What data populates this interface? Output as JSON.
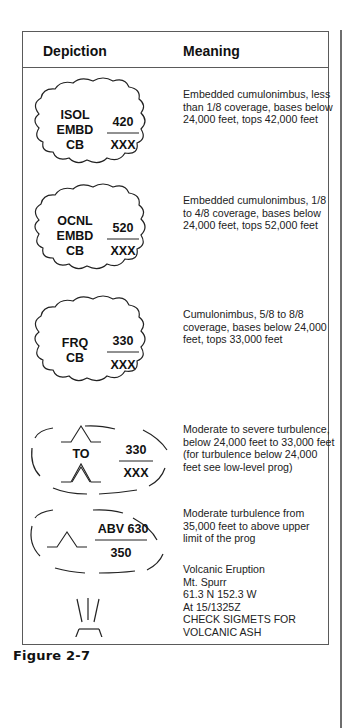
{
  "table": {
    "headers": {
      "depiction": "Depiction",
      "meaning": "Meaning"
    },
    "rows": [
      {
        "symbol": {
          "type": "cloud",
          "left_lines": [
            "ISOL",
            "EMBD",
            "CB"
          ],
          "top": "420",
          "bottom": "XXX"
        },
        "meaning_lines": [
          "Embedded cumulonimbus, less",
          "than 1/8 coverage, bases below",
          "24,000 feet, tops 42,000 feet"
        ]
      },
      {
        "symbol": {
          "type": "cloud",
          "left_lines": [
            "OCNL",
            "EMBD",
            "CB"
          ],
          "top": "520",
          "bottom": "XXX"
        },
        "meaning_lines": [
          "Embedded cumulonimbus, 1/8",
          "to 4/8 coverage, bases below",
          "24,000 feet, tops 52,000 feet"
        ]
      },
      {
        "symbol": {
          "type": "cloud",
          "left_lines": [
            "FRQ",
            "CB"
          ],
          "top": "330",
          "bottom": "XXX"
        },
        "meaning_lines": [
          "Cumulonimbus, 5/8 to 8/8",
          "coverage, bases below 24,000",
          "feet, tops 33,000 feet"
        ]
      },
      {
        "symbol": {
          "type": "turbulence-dashed",
          "left_label": "TO",
          "top": "330",
          "bottom": "XXX"
        },
        "meaning_lines": [
          "Moderate to severe turbulence,",
          "below 24,000 feet to 33,000 feet",
          "(for turbulence below 24,000",
          "feet see low-level prog)"
        ]
      },
      {
        "symbol": {
          "type": "turbulence-dashed",
          "top": "ABV 630",
          "bottom": "350"
        },
        "meaning_lines": [
          "Moderate turbulence from",
          "35,000 feet to above upper",
          "limit of the prog"
        ]
      },
      {
        "symbol": {
          "type": "volcano"
        },
        "meaning_lines": [
          "Volcanic Eruption",
          "Mt. Spurr",
          "61.3 N 152.3 W",
          "At 15/1325Z",
          "CHECK SIGMETS FOR",
          "VOLCANIC ASH"
        ]
      }
    ]
  },
  "caption": "Figure 2-7"
}
